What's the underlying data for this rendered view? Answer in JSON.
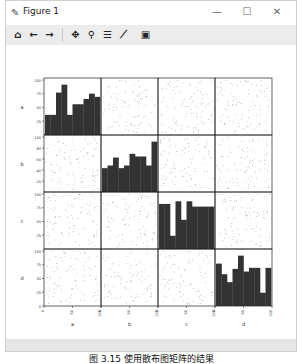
{
  "window": {
    "title": "Figure 1",
    "title_icon": "figure-icon",
    "controls": {
      "minimize": "—",
      "maximize": "☐",
      "close": "✕"
    }
  },
  "toolbar": {
    "buttons": [
      {
        "name": "home-icon",
        "glyph": "⌂"
      },
      {
        "name": "back-icon",
        "glyph": "←"
      },
      {
        "name": "forward-icon",
        "glyph": "→"
      },
      {
        "name": "pan-icon",
        "glyph": "✥"
      },
      {
        "name": "zoom-icon",
        "glyph": "⚲"
      },
      {
        "name": "configure-subplots-icon",
        "glyph": "☰"
      },
      {
        "name": "edit-axes-icon",
        "glyph": "⟋"
      },
      {
        "name": "save-icon",
        "glyph": "▣"
      }
    ]
  },
  "caption": "图 3.15 使用散布图矩阵的结果",
  "chart_data": {
    "type": "scatter_matrix",
    "variables": [
      "a",
      "b",
      "c",
      "d"
    ],
    "diagonal": "hist",
    "bar_color": "#333333",
    "point_color": "#888888",
    "xticks": {
      "a": [
        "0",
        "50",
        "100"
      ],
      "b": [
        "0",
        "50",
        "100"
      ],
      "c": [
        "0",
        "50",
        "100"
      ],
      "d": [
        "0",
        "50",
        "100"
      ]
    },
    "yticks": {
      "a": [
        "25",
        "50",
        "75",
        "100"
      ],
      "b": [
        "20",
        "40",
        "60",
        "80",
        "100"
      ],
      "c": [
        "25",
        "50",
        "75",
        "100"
      ],
      "d": [
        "0",
        "25",
        "50",
        "75",
        "100"
      ]
    },
    "histograms": {
      "a": [
        0.38,
        0.38,
        0.8,
        0.95,
        0.38,
        0.58,
        0.58,
        0.68,
        0.78,
        0.72
      ],
      "b": [
        0.45,
        0.5,
        0.65,
        0.45,
        0.5,
        0.72,
        0.67,
        0.67,
        0.5,
        0.95
      ],
      "c": [
        0.85,
        0.85,
        0.25,
        0.9,
        0.55,
        0.9,
        0.8,
        0.8,
        0.8,
        0.8
      ],
      "d": [
        0.8,
        0.6,
        0.45,
        0.7,
        0.95,
        0.65,
        0.72,
        0.72,
        0.25,
        0.72
      ]
    },
    "xlim": [
      0,
      100
    ],
    "ylim": [
      0,
      100
    ]
  }
}
